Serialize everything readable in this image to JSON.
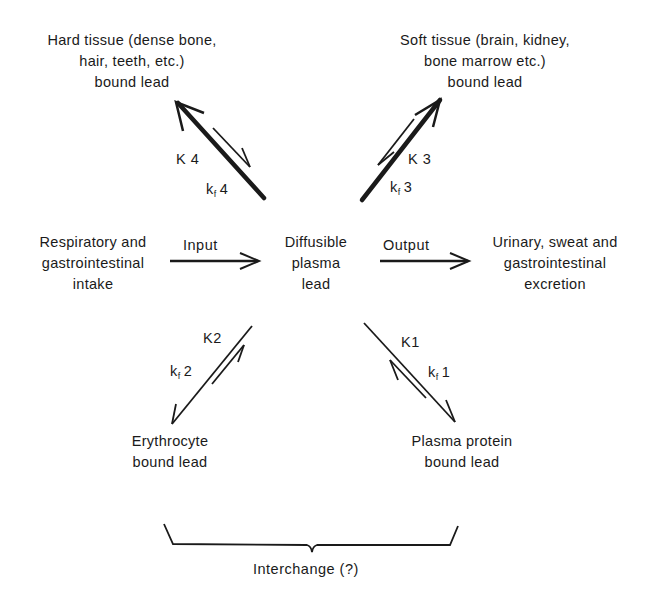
{
  "nodes": {
    "hard_tissue": [
      "Hard tissue (dense bone,",
      "hair, teeth, etc.)",
      "bound lead"
    ],
    "soft_tissue": [
      "Soft tissue (brain, kidney,",
      "bone marrow etc.)",
      "bound lead"
    ],
    "intake": [
      "Respiratory and",
      "gastrointestinal",
      "intake"
    ],
    "plasma": [
      "Diffusible",
      "plasma",
      "lead"
    ],
    "excretion": [
      "Urinary, sweat and",
      "gastrointestinal",
      "excretion"
    ],
    "erythrocyte": [
      "Erythrocyte",
      "bound lead"
    ],
    "plasma_protein": [
      "Plasma protein",
      "bound lead"
    ]
  },
  "edges": {
    "input": "Input",
    "output": "Output",
    "k4": {
      "main": "K 4",
      "sub_prefix": "k",
      "sub": "f",
      "suffix": "4"
    },
    "k3": {
      "main": "K 3",
      "sub_prefix": "k",
      "sub": "f",
      "suffix": "3"
    },
    "k2": {
      "main": "K2",
      "sub_prefix": "k",
      "sub": "f",
      "suffix": "2"
    },
    "k1": {
      "main": "K1",
      "sub_prefix": "k",
      "sub": "f",
      "suffix": "1"
    }
  },
  "interchange": "Interchange (?)",
  "colors": {
    "ink": "#1a1a1a",
    "background": "#ffffff"
  }
}
